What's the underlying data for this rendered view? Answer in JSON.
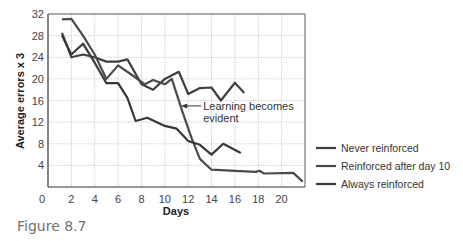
{
  "figure": {
    "caption": "Figure 8.7"
  },
  "chart_data": {
    "type": "line",
    "title": "",
    "xlabel": "Days",
    "ylabel": "Average errors x 3",
    "xlim": [
      0,
      22
    ],
    "ylim": [
      0,
      32
    ],
    "grid": true,
    "x_ticks": [
      0,
      2,
      4,
      6,
      8,
      10,
      12,
      14,
      16,
      18,
      20
    ],
    "y_ticks": [
      4,
      8,
      12,
      16,
      20,
      24,
      28,
      32
    ],
    "legend_position": "right",
    "annotations": [
      {
        "text": [
          "Learning becomes",
          "evident"
        ],
        "arrow_to": [
          11.4,
          15
        ],
        "text_at": [
          12.5,
          14.8
        ]
      }
    ],
    "series": [
      {
        "name": "Never reinforced",
        "color": "#3f3f3f",
        "points": [
          [
            1.2,
            28.5
          ],
          [
            2,
            24
          ],
          [
            3,
            24.5
          ],
          [
            4,
            24
          ],
          [
            5,
            23.2
          ],
          [
            6,
            23.2
          ],
          [
            6.8,
            23.6
          ],
          [
            8,
            19
          ],
          [
            9,
            18
          ],
          [
            10,
            20
          ],
          [
            11.2,
            21.3
          ],
          [
            12,
            17.2
          ],
          [
            13,
            18.3
          ],
          [
            14,
            18.4
          ],
          [
            14.8,
            16
          ],
          [
            16,
            19.3
          ],
          [
            16.8,
            17.4
          ]
        ]
      },
      {
        "name": "Reinforced after day 10",
        "color": "#4a4a4a",
        "points": [
          [
            1.2,
            31
          ],
          [
            2,
            31.1
          ],
          [
            3,
            28
          ],
          [
            4,
            24.5
          ],
          [
            5,
            20
          ],
          [
            6,
            22.5
          ],
          [
            7,
            21
          ],
          [
            8.3,
            19
          ],
          [
            9,
            19.8
          ],
          [
            10,
            19
          ],
          [
            10.6,
            20
          ],
          [
            11.5,
            14
          ],
          [
            12.3,
            9
          ],
          [
            13,
            5.2
          ],
          [
            14,
            3.2
          ],
          [
            16,
            3
          ],
          [
            17.8,
            2.8
          ],
          [
            18.1,
            3
          ],
          [
            18.5,
            2.5
          ],
          [
            21,
            2.6
          ],
          [
            21.8,
            1
          ]
        ]
      },
      {
        "name": "Always reinforced",
        "color": "#383838",
        "points": [
          [
            1.2,
            28
          ],
          [
            2,
            24.5
          ],
          [
            3,
            26.5
          ],
          [
            4,
            23
          ],
          [
            5,
            19.2
          ],
          [
            6,
            19.2
          ],
          [
            6.8,
            16.5
          ],
          [
            7.5,
            12.2
          ],
          [
            8.5,
            12.8
          ],
          [
            10,
            11.3
          ],
          [
            11,
            10.8
          ],
          [
            12,
            8.5
          ],
          [
            13,
            7.8
          ],
          [
            14,
            6
          ],
          [
            15,
            8
          ],
          [
            16.5,
            6.3
          ]
        ]
      }
    ]
  }
}
